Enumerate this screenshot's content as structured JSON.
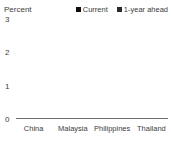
{
  "chart_data": {
    "type": "bar",
    "title": "",
    "ylabel": "Percent",
    "xlabel": "",
    "categories": [
      "China",
      "Malaysia",
      "Philippines",
      "Thailand"
    ],
    "series": [
      {
        "name": "Current",
        "color": "#0d0d0d",
        "values": [
          2.8,
          0.55,
          2.85,
          1.7
        ]
      },
      {
        "name": "1-year ahead",
        "color": "#2a2a2a",
        "values": [
          1.8,
          0.4,
          2.6,
          0.7
        ]
      }
    ],
    "ylim": [
      0,
      3
    ],
    "yticks": [
      0,
      1,
      2,
      3
    ],
    "grid": false,
    "legend_position": "top",
    "background_color": "#ffffff",
    "text_color": "#3d3d3d"
  }
}
